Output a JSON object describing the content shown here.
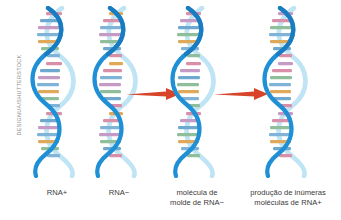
{
  "figure": {
    "background_color": "#ffffff",
    "credit": "DESIGNUA/SHUTTERSTOCK",
    "credit_color": "#8e8e8e",
    "arrow_color": "#d8442a",
    "label_color": "#3a3a3a"
  },
  "panels": [
    {
      "id": "panel-rna-plus",
      "icon": "rna-helix-icon",
      "caption_lines": [
        "RNA+",
        ""
      ]
    },
    {
      "id": "panel-rna-minus",
      "icon": "rna-helix-icon",
      "caption_lines": [
        "RNA−",
        ""
      ]
    },
    {
      "id": "panel-template",
      "icon": "rna-helix-icon",
      "caption_lines": [
        "molécula de",
        "molde de RNA−"
      ]
    },
    {
      "id": "panel-production",
      "icon": "rna-helix-icon",
      "caption_lines": [
        "produção de inúmeras",
        "moléculas de RNA+"
      ]
    }
  ],
  "arrows": [
    {
      "id": "arrow-1",
      "direction": "right",
      "icon": "arrow-right-icon"
    },
    {
      "id": "arrow-2",
      "direction": "right",
      "icon": "arrow-right-icon"
    }
  ],
  "helix": {
    "strand_front_color": "#1f8fd6",
    "strand_back_color": "#bfe4f4",
    "base_colors": [
      "#d98fa8",
      "#7fb3d8",
      "#e0a95a",
      "#8fbf9a",
      "#c59ac4",
      "#6fa8cf"
    ],
    "base_rungs_per_helix": 21
  }
}
